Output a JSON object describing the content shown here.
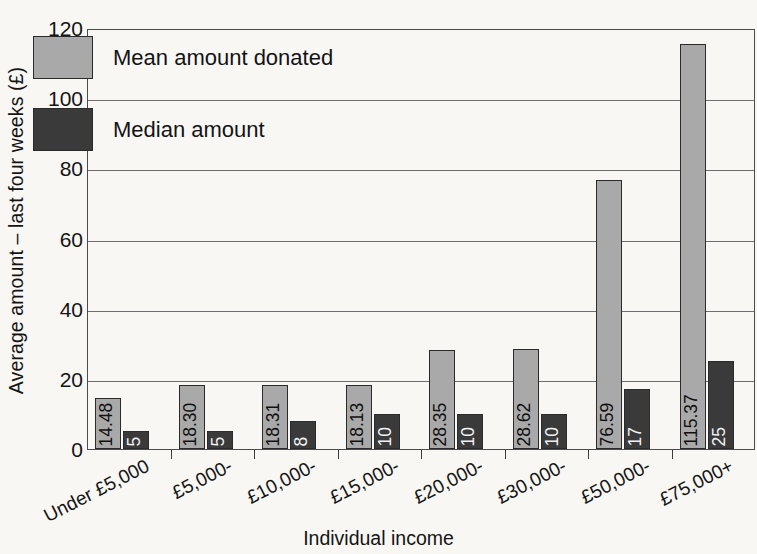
{
  "chart_data": {
    "type": "bar",
    "title": "",
    "xlabel": "Individual income",
    "ylabel": "Average amount – last four weeks (£)",
    "categories": [
      "Under £5,000",
      "£5,000-",
      "£10,000-",
      "£15,000-",
      "£20,000-",
      "£30,000-",
      "£50,000-",
      "£75,000+"
    ],
    "series": [
      {
        "name": "Mean amount donated",
        "color": "#a9a9a9",
        "values": [
          14.48,
          18.3,
          18.31,
          18.13,
          28.35,
          28.62,
          76.59,
          115.37
        ],
        "labels": [
          "14.48",
          "18.30",
          "18.31",
          "18.13",
          "28.35",
          "28.62",
          "76.59",
          "115.37"
        ]
      },
      {
        "name": "Median amount",
        "color": "#3a3a3a",
        "values": [
          5,
          5,
          8,
          10,
          10,
          10,
          17,
          25
        ],
        "labels": [
          "5",
          "5",
          "8",
          "10",
          "10",
          "10",
          "17",
          "25"
        ]
      }
    ],
    "ylim": [
      0,
      120
    ],
    "yticks": [
      0,
      20,
      40,
      60,
      80,
      100,
      120
    ],
    "ytick_labels": [
      "0",
      "20",
      "40",
      "60",
      "80",
      "100",
      "120"
    ],
    "grid": "horizontal",
    "legend_position": "top-left"
  },
  "legend": {
    "items": [
      {
        "label": "Mean amount donated",
        "color": "#a9a9a9"
      },
      {
        "label": "Median amount",
        "color": "#3a3a3a"
      }
    ]
  },
  "axes": {
    "y_title": "Average amount – last four weeks (£)",
    "x_title": "Individual income"
  }
}
